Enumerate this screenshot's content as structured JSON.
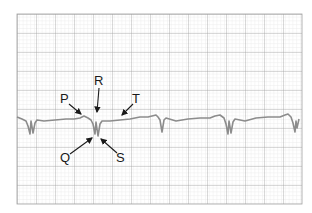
{
  "diagram": {
    "labels": {
      "P": "P",
      "Q": "Q",
      "R": "R",
      "S": "S",
      "T": "T"
    },
    "colors": {
      "grid_minor": "#d9d9d9",
      "grid_major": "#9a9a9a",
      "trace": "#8c8c8c",
      "arrow": "#1a1a1a"
    }
  }
}
